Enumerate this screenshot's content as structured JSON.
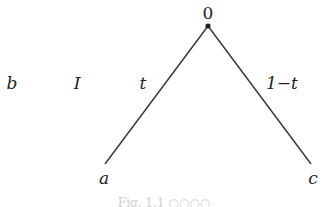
{
  "diagram": {
    "root": {
      "label": "0",
      "x": 208,
      "y": 26
    },
    "leaves": [
      {
        "id": "a",
        "label": "a",
        "x": 105,
        "y": 164
      },
      {
        "id": "c",
        "label": "c",
        "x": 311,
        "y": 164
      }
    ],
    "edges": [
      {
        "from": "0",
        "to": "a",
        "label": "t"
      },
      {
        "from": "0",
        "to": "c",
        "label": "1−t"
      }
    ],
    "side_labels": [
      {
        "label": "b"
      },
      {
        "label": "I"
      }
    ],
    "caption": "Fig. 1.1   ○○○○"
  }
}
